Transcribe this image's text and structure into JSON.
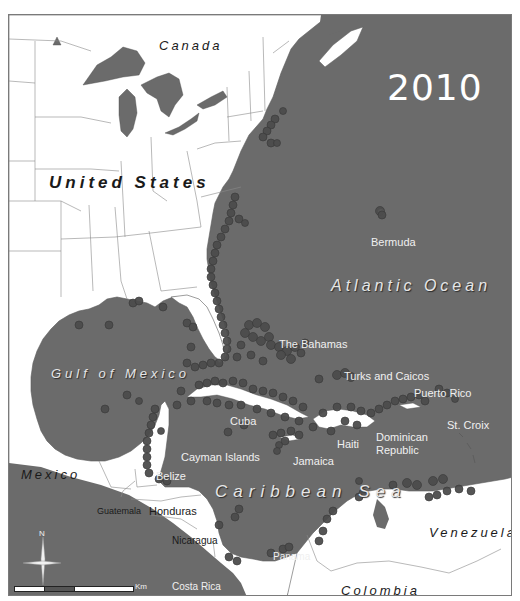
{
  "map": {
    "title_year": "2010",
    "colors": {
      "ocean": "#6b6b6b",
      "land": "#ffffff",
      "border": "#8a8a8a",
      "record_dot": "#4c4c4c",
      "record_dot_outline": "#3a3a3a",
      "frame": "#7a7a7a"
    },
    "water_labels": {
      "atlantic": "Atlantic Ocean",
      "gulf": "Gulf of Mexico",
      "caribbean": "Caribbean Sea"
    },
    "country_labels": {
      "canada": "Canada",
      "united_states": "United States",
      "mexico": "Mexico",
      "venezuela": "Venezuela",
      "colombia": "Colombia",
      "guatemala": "Guatemala",
      "honduras": "Honduras",
      "nicaragua": "Nicaragua",
      "costa_rica": "Costa Rica",
      "panama": "Panama",
      "belize": "Belize"
    },
    "island_labels": {
      "bermuda": "Bermuda",
      "bahamas": "The Bahamas",
      "turks_caicos": "Turks and Caicos",
      "puerto_rico": "Puerto Rico",
      "st_croix": "St. Croix",
      "cuba": "Cuba",
      "cayman": "Cayman Islands",
      "jamaica": "Jamaica",
      "haiti": "Haiti",
      "dominican_republic_1": "Dominican",
      "dominican_republic_2": "Republic"
    },
    "north_arrow": {
      "label": "N",
      "icon": "compass-rose-icon"
    },
    "scale_bar": {
      "unit": "Km",
      "ticks": [
        "0",
        "250",
        "500",
        "1,000"
      ]
    }
  }
}
